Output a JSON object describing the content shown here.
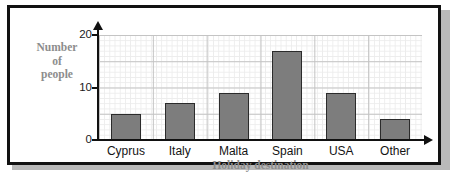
{
  "chart_data": {
    "type": "bar",
    "title": "",
    "categories": [
      "Cyprus",
      "Italy",
      "Malta",
      "Spain",
      "USA",
      "Other"
    ],
    "values": [
      5,
      7,
      9,
      17,
      9,
      4
    ],
    "xlabel": "Holiday destination",
    "ylabel_lines": [
      "Number",
      "of",
      "people"
    ],
    "ylabel": "Number of people",
    "ylim": [
      0,
      20
    ],
    "ytick_labels": [
      "0",
      "10",
      "20"
    ],
    "ytick_values": [
      0,
      10,
      20
    ],
    "y_major_step": 5,
    "y_minor_step": 1,
    "grid": true,
    "legend": "none",
    "colors": {
      "bar_fill": "#7d7d7d",
      "bar_stroke": "#2b2b2b",
      "axis": "#111111",
      "grid_major": "#c3c3c3",
      "grid_minor": "#ececec",
      "label_text": "#8d8d8d",
      "tick_text": "#1a1a1a",
      "frame": "#121212",
      "background": "#ffffff"
    }
  }
}
